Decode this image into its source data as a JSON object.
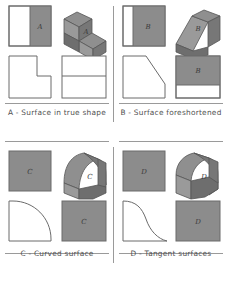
{
  "figure": {
    "panel_count": 4,
    "line_color": "#6b6b6b",
    "shade_color": "#8c8c8c",
    "caption_color": "#515151",
    "background": "#ffffff"
  },
  "panels": [
    {
      "key": "A",
      "letter": "A",
      "caption": "A - Surface in true shape",
      "views": {
        "top_left": {
          "name": "top-view-square-with-shaded-right-half",
          "shape": "square",
          "shaded_region": "right-half",
          "label": "A"
        },
        "top_right": {
          "name": "isometric-step-block",
          "shape": "isometric-pictorial",
          "solid": "step block",
          "label": "A"
        },
        "bottom_left": {
          "name": "front-view-l-shape",
          "shape": "L-shape step profile",
          "shaded_region": "none",
          "label": ""
        },
        "bottom_right": {
          "name": "side-view-rectangle-split",
          "shape": "rectangle divided by horizontal line",
          "shaded_region": "none",
          "label": ""
        }
      }
    },
    {
      "key": "B",
      "letter": "B",
      "caption": "B - Surface foreshortened",
      "views": {
        "top_left": {
          "name": "top-view-square-with-shaded-right",
          "shape": "square",
          "shaded_region": "right-portion",
          "label": "B"
        },
        "top_right": {
          "name": "isometric-inclined-wedge",
          "shape": "isometric-pictorial",
          "solid": "inclined wedge",
          "label": "B"
        },
        "bottom_left": {
          "name": "front-view-chamfered-square",
          "shape": "square with chamfered upper-right corner",
          "shaded_region": "none",
          "label": ""
        },
        "bottom_right": {
          "name": "side-view-rectangle-shaded-upper",
          "shape": "rectangle with shaded upper band",
          "shaded_region": "upper-band",
          "label": "B"
        }
      }
    },
    {
      "key": "C",
      "letter": "C",
      "caption": "C - Curved surface",
      "views": {
        "top_left": {
          "name": "top-view-shaded-square",
          "shape": "square",
          "shaded_region": "full",
          "label": "C"
        },
        "top_right": {
          "name": "isometric-quarter-round-block",
          "shape": "isometric-pictorial",
          "solid": "quarter round block",
          "label": "C"
        },
        "bottom_left": {
          "name": "front-view-quarter-arc",
          "shape": "quarter circle arc profile",
          "shaded_region": "none",
          "label": ""
        },
        "bottom_right": {
          "name": "side-view-shaded-square",
          "shape": "square",
          "shaded_region": "full",
          "label": "C"
        }
      }
    },
    {
      "key": "D",
      "letter": "D",
      "caption": "D - Tangent surfaces",
      "views": {
        "top_left": {
          "name": "top-view-shaded-square",
          "shape": "square",
          "shaded_region": "full",
          "label": "D"
        },
        "top_right": {
          "name": "isometric-tangent-curve-block",
          "shape": "isometric-pictorial",
          "solid": "block with tangent curved face",
          "label": "D"
        },
        "bottom_left": {
          "name": "front-view-tangent-curve",
          "shape": "tangent curve profile",
          "shaded_region": "none",
          "label": ""
        },
        "bottom_right": {
          "name": "side-view-shaded-square",
          "shape": "square",
          "shaded_region": "full",
          "label": "D"
        }
      }
    }
  ]
}
